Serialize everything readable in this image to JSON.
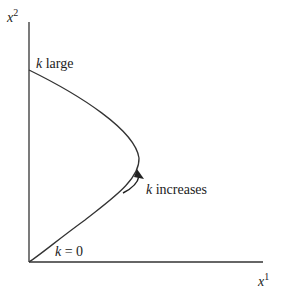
{
  "axes": {
    "x_label": "x",
    "x_sup": "1",
    "y_label": "x",
    "y_sup": "2"
  },
  "annotations": {
    "k_large": {
      "k": "k",
      "text": " large"
    },
    "k_zero": {
      "k": "k",
      "text": " = 0"
    },
    "k_increases": {
      "k": "k",
      "text": " increases"
    }
  },
  "colors": {
    "line": "#333333",
    "background": "#ffffff"
  }
}
